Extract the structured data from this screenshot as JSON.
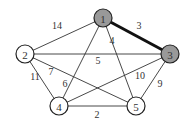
{
  "diagram": {
    "type": "weighted-graph",
    "colors": {
      "edge": "#333333",
      "highlight_edge": "#111111",
      "node_fill_default": "#ffffff",
      "node_fill_highlight": "#999999",
      "node_stroke": "#222222",
      "text": "#333333"
    },
    "nodes": [
      {
        "id": "1",
        "label": "1",
        "x": 103,
        "y": 18,
        "highlighted": true
      },
      {
        "id": "2",
        "label": "2",
        "x": 25,
        "y": 54,
        "highlighted": false
      },
      {
        "id": "3",
        "label": "3",
        "x": 170,
        "y": 54,
        "highlighted": true
      },
      {
        "id": "4",
        "label": "4",
        "x": 59,
        "y": 106,
        "highlighted": false
      },
      {
        "id": "5",
        "label": "5",
        "x": 136,
        "y": 106,
        "highlighted": false
      }
    ],
    "edges": [
      {
        "from": "1",
        "to": "2",
        "weight": "14",
        "lx": 57,
        "ly": 25,
        "highlighted": false
      },
      {
        "from": "1",
        "to": "3",
        "weight": "3",
        "lx": 139,
        "ly": 25,
        "highlighted": true
      },
      {
        "from": "1",
        "to": "4",
        "weight": "6",
        "lx": 65,
        "ly": 83,
        "highlighted": false
      },
      {
        "from": "1",
        "to": "5",
        "weight": "4",
        "lx": 112,
        "ly": 40,
        "highlighted": false
      },
      {
        "from": "2",
        "to": "3",
        "weight": "5",
        "lx": 98,
        "ly": 60,
        "highlighted": false
      },
      {
        "from": "2",
        "to": "4",
        "weight": "11",
        "lx": 35,
        "ly": 76,
        "highlighted": false
      },
      {
        "from": "2",
        "to": "5",
        "weight": "7",
        "lx": 51,
        "ly": 71,
        "highlighted": false
      },
      {
        "from": "3",
        "to": "4",
        "weight": "10",
        "lx": 140,
        "ly": 75,
        "highlighted": false
      },
      {
        "from": "3",
        "to": "5",
        "weight": "9",
        "lx": 160,
        "ly": 83,
        "highlighted": false
      },
      {
        "from": "4",
        "to": "5",
        "weight": "2",
        "lx": 97,
        "ly": 114,
        "highlighted": false
      }
    ]
  }
}
